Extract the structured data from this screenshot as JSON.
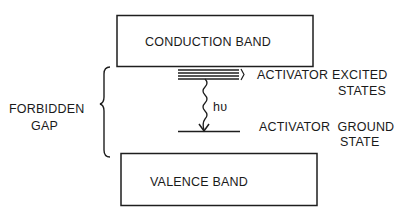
{
  "diagram": {
    "type": "energy-band-diagram",
    "conduction_band": {
      "label": "CONDUCTION BAND"
    },
    "valence_band": {
      "label": "VALENCE BAND"
    },
    "forbidden_gap": {
      "label_line1": "FORBIDDEN",
      "label_line2": "GAP"
    },
    "excited_states": {
      "label_line1": "ACTIVATOR EXCITED",
      "label_line2": "STATES",
      "level_count": 4
    },
    "ground_state": {
      "label_line1": "ACTIVATOR  GROUND",
      "label_line2": "STATE"
    },
    "emission": {
      "label": "hυ"
    },
    "colors": {
      "ink": "#1e1e1e",
      "background": "#ffffff"
    }
  }
}
